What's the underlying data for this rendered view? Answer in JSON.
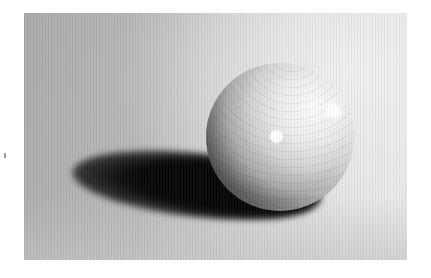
{
  "image": {
    "subject": "wooden sphere with two white dots casting a shadow",
    "style": "grayscale photograph",
    "colors": {
      "background_dark": "#a9a9a9",
      "background_light": "#e6e6e6",
      "shadow": "#050505",
      "highlight": "#ffffff"
    },
    "elements": {
      "sphere": {
        "center": [
          280,
          137
        ],
        "radius": 74
      },
      "dots": [
        {
          "center": [
            276,
            130
          ],
          "radius": 6
        },
        {
          "center": [
            333,
            104
          ],
          "radius": 6
        }
      ],
      "shadow": {
        "extent_x": [
          70,
          300
        ],
        "extent_y": [
          150,
          215
        ]
      }
    }
  }
}
